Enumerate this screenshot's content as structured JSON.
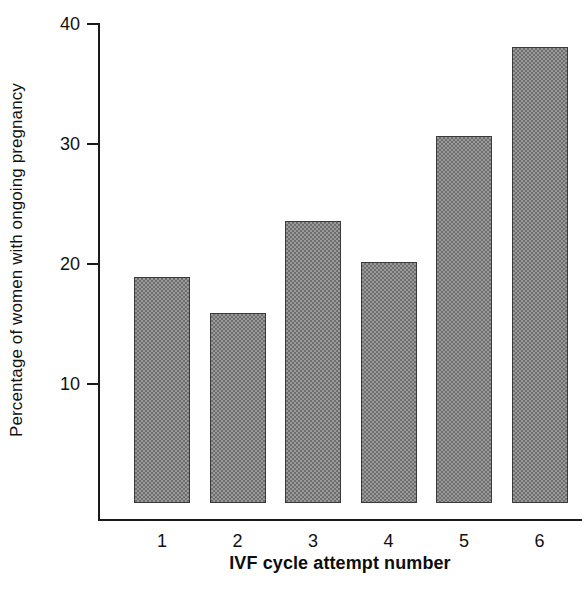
{
  "chart_data": {
    "type": "bar",
    "title": "",
    "xlabel": "IVF cycle attempt number",
    "ylabel": "Percentage of women with ongoing pregnancy",
    "categories": [
      "1",
      "2",
      "3",
      "4",
      "5",
      "6"
    ],
    "values": [
      18.8,
      15.8,
      23.5,
      20.1,
      30.6,
      38.0
    ],
    "yticks": [
      10,
      20,
      30,
      40
    ],
    "ytick_labels": [
      "10",
      "20",
      "30",
      "40"
    ],
    "ylim": [
      0,
      40
    ],
    "xlim_categories": 6,
    "grid": false,
    "legend": null,
    "bar_fill_color": "#9a9a9a",
    "bar_pattern": "checkered-dither-gray",
    "bar_edge_color": "#3a3a3a",
    "axis_color": "#1a1a1a",
    "background_color": "#ffffff"
  }
}
